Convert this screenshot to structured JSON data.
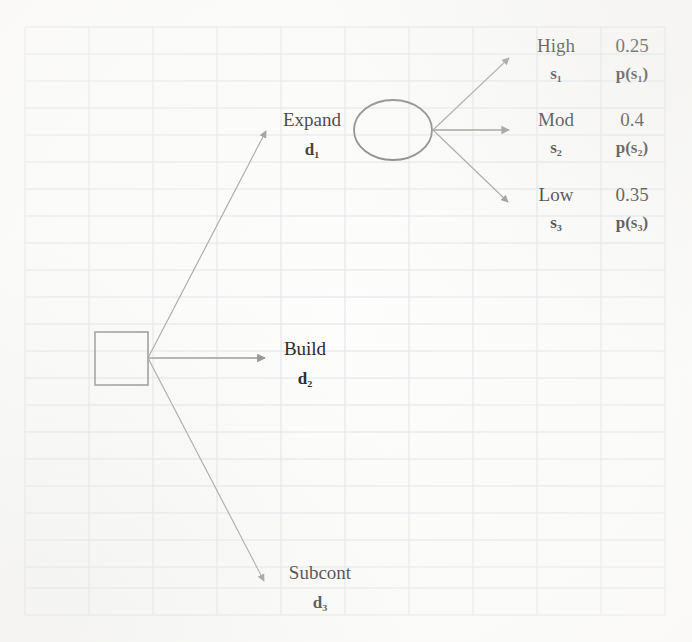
{
  "diagram": {
    "nodes": {
      "decision": {
        "name": "decision-node",
        "shape": "square"
      },
      "chance": {
        "name": "chance-node",
        "shape": "circle"
      }
    },
    "decision_branches": [
      {
        "label": "Expand",
        "code": "d",
        "index": "1"
      },
      {
        "label": "Build",
        "code": "d",
        "index": "2"
      },
      {
        "label": "Subcont",
        "code": "d",
        "index": "3"
      }
    ],
    "states": [
      {
        "label": "High",
        "code": "s",
        "index": "1",
        "probability": "0.25",
        "prob_symbol": "p(s",
        "prob_index": "1"
      },
      {
        "label": "Mod",
        "code": "s",
        "index": "2",
        "probability": "0.4",
        "prob_symbol": "p(s",
        "prob_index": "2"
      },
      {
        "label": "Low",
        "code": "s",
        "index": "3",
        "probability": "0.35",
        "prob_symbol": "p(s",
        "prob_index": "3"
      }
    ],
    "colors": {
      "ink": "#1b1b1b",
      "stroke": "#8a8a88",
      "grid": "#dfe3e8",
      "paper": "#fdfdfc"
    }
  },
  "labels": {
    "expand": "Expand",
    "expand_code": "d₁",
    "build": "Build",
    "build_code": "d₂",
    "subcont": "Subcont",
    "subcont_code": "d₃",
    "high": "High",
    "high_code": "s₁",
    "high_prob": "0.25",
    "high_prob_sym": "p(s₁)",
    "mod": "Mod",
    "mod_code": "s₂",
    "mod_prob": "0.4",
    "mod_prob_sym": "p(s₂)",
    "low": "Low",
    "low_code": "s₃",
    "low_prob": "0.35",
    "low_prob_sym": "p(s₃)"
  }
}
